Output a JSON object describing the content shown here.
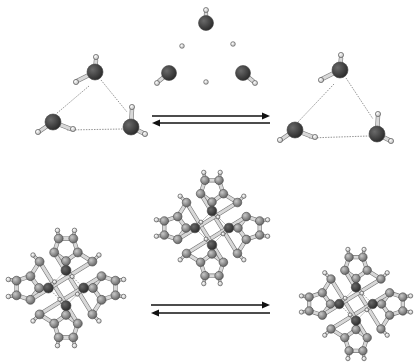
{
  "figure": {
    "width": 418,
    "height": 364,
    "colors": {
      "oxygen": "#2e2e2e",
      "carbon": "#8e8e8e",
      "hydrogen": "#f2f2f2",
      "bond": "#d8d8d8",
      "hbond": "#666666",
      "arrow": "#111111"
    },
    "rows": [
      {
        "name": "water-trimer-row",
        "structures": [
          {
            "name": "trimer-left",
            "type": "trimer",
            "cx": 95,
            "cy": 103,
            "variant": "cyclic"
          },
          {
            "name": "trimer-transition",
            "type": "trimer",
            "cx": 206,
            "cy": 70,
            "variant": "dissociated"
          },
          {
            "name": "trimer-right",
            "type": "trimer",
            "cx": 340,
            "cy": 108,
            "variant": "cyclic-flipped"
          }
        ],
        "equilibrium_arrow": {
          "x1": 152,
          "x2": 270,
          "y_forward": 116,
          "y_back": 123
        }
      },
      {
        "name": "macrocycle-row",
        "structures": [
          {
            "name": "macrocycle-left",
            "type": "macrocycle",
            "cx": 66,
            "cy": 288,
            "r": 57
          },
          {
            "name": "macrocycle-transition",
            "type": "macrocycle",
            "cx": 212,
            "cy": 228,
            "r": 55
          },
          {
            "name": "macrocycle-right",
            "type": "macrocycle",
            "cx": 356,
            "cy": 304,
            "r": 54
          }
        ],
        "equilibrium_arrow": {
          "x1": 151,
          "x2": 270,
          "y_forward": 305,
          "y_back": 313
        }
      }
    ]
  }
}
